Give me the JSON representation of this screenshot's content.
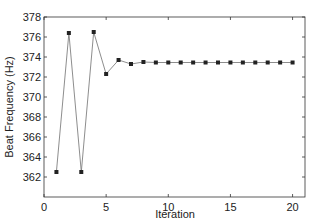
{
  "chart_data": {
    "type": "line",
    "title": "",
    "xlabel": "Iteration",
    "ylabel": "Beat Frequency (Hz)",
    "xlim": [
      0,
      21
    ],
    "ylim": [
      360,
      378
    ],
    "xticks": [
      0,
      5,
      10,
      15,
      20
    ],
    "yticks": [
      362,
      364,
      366,
      368,
      370,
      372,
      374,
      376,
      378
    ],
    "grid": false,
    "legend": null,
    "marker": "square",
    "line_color": "#808080",
    "marker_color": "#222222",
    "series": [
      {
        "name": "Beat Frequency",
        "x": [
          1,
          2,
          3,
          4,
          5,
          6,
          7,
          8,
          9,
          10,
          11,
          12,
          13,
          14,
          15,
          16,
          17,
          18,
          19,
          20
        ],
        "values": [
          362.5,
          376.4,
          362.5,
          376.5,
          372.3,
          373.7,
          373.3,
          373.5,
          373.45,
          373.45,
          373.45,
          373.45,
          373.45,
          373.45,
          373.45,
          373.45,
          373.45,
          373.45,
          373.45,
          373.45
        ]
      }
    ]
  }
}
